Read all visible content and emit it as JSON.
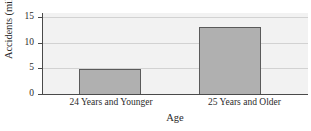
{
  "chart_data": {
    "type": "bar",
    "title": "",
    "subtitle": "",
    "categories": [
      "24 Years and Younger",
      "25 Years and Older"
    ],
    "values": [
      5.0,
      13.3
    ],
    "xlabel": "Age",
    "ylabel": "Accidents (millions)",
    "ylim": [
      0,
      16
    ],
    "yticks": [
      0,
      5,
      10,
      15
    ],
    "ytick_labels": [
      "0",
      "5",
      "10",
      "15"
    ],
    "grid": true,
    "grid_axis": "y",
    "legend": false,
    "legend_position": "none",
    "annotations": [],
    "colors": {
      "bar_fill": "#b0b0b0",
      "bar_border": "#5a5a5a",
      "plot_background": "#f2f2f2",
      "gridline": "#d2d2d2",
      "axis": "#4a4a4a",
      "text": "#2b2b2b",
      "page_background": "#ffffff"
    }
  }
}
